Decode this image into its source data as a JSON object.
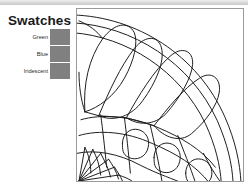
{
  "window": {
    "top_band": "toolbar-strip"
  },
  "swatches": {
    "title": "Swatches",
    "chip_color": "#808080",
    "items": [
      {
        "label": "Green",
        "color": "#808080"
      },
      {
        "label": "Blue",
        "color": "#808080"
      },
      {
        "label": "Iridescent",
        "color": "#808080"
      }
    ]
  },
  "artwork": {
    "name": "stained-glass-fan-pattern",
    "description": "Line-art quarter fan / shell motif with radiating petal cells and lattice",
    "stroke_color": "#1c1c1c",
    "background": "#ffffff",
    "border_color": "#9a9a9a"
  }
}
